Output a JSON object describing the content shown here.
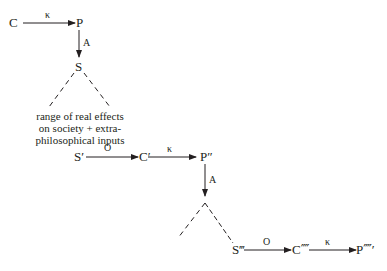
{
  "diagram": {
    "nodes": {
      "c": "C",
      "p": "P",
      "s": "S",
      "s1": "S′",
      "c1": "C′",
      "p1": "P″",
      "s3": "S‴",
      "c4": "C⁗",
      "p5": "P⁗′"
    },
    "edges": {
      "c_p": "κ",
      "p_s": "A",
      "s1_c1": "O",
      "c1_p1": "κ",
      "p1_down": "A",
      "s3_c4": "O",
      "c4_p5": "κ"
    },
    "note": {
      "line1": "range of real effects",
      "line2": "on society + extra-",
      "line3": "philosophical inputs"
    }
  }
}
